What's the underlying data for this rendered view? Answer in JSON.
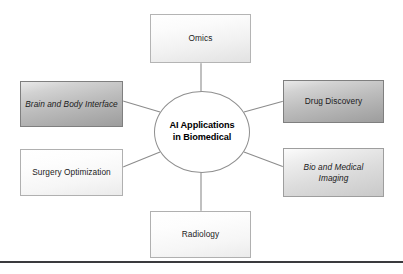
{
  "diagram": {
    "type": "radial-hub-and-spoke",
    "hub": {
      "line1": "AI Applications",
      "line2": "in Biomedical"
    },
    "nodes": [
      {
        "id": "omics",
        "label": "Omics",
        "position": "top",
        "shade": "light"
      },
      {
        "id": "drug",
        "label": "Drug Discovery",
        "position": "right-top",
        "shade": "dark"
      },
      {
        "id": "imaging",
        "line1": "Bio and Medical",
        "line2": "Imaging",
        "label": "Bio and Medical Imaging",
        "position": "right-bottom",
        "shade": "mid"
      },
      {
        "id": "radiology",
        "label": "Radiology",
        "position": "bottom",
        "shade": "light2"
      },
      {
        "id": "surgery",
        "label": "Surgery Optimization",
        "position": "left-bottom",
        "shade": "light2"
      },
      {
        "id": "brain",
        "line1": "Brain and Body",
        "line2": "Interface",
        "label": "Brain and Body Interface",
        "position": "left-top",
        "shade": "dark"
      }
    ],
    "colors": {
      "background": "#ffffff",
      "box_border": "#9a9a9a",
      "connector": "#8c8c8c",
      "hub_fill": "#ffffff",
      "hub_border": "#8f8f8f",
      "text": "#1b1b1b",
      "rule": "#3a3a3e"
    }
  }
}
